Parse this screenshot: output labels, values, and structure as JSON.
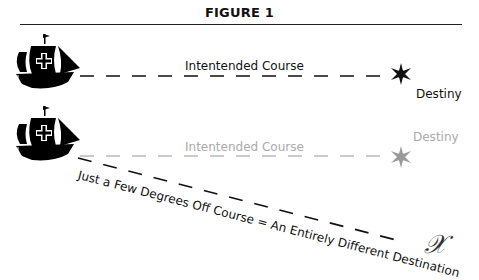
{
  "figure": {
    "title": "FIGURE 1",
    "top_course": {
      "label": "Intentended Course",
      "destination_label": "Destiny",
      "color": "#111111"
    },
    "bottom_course": {
      "label": "Intentended Course",
      "destination_label": "Destiny",
      "color": "#aaaaaa"
    },
    "off_course": {
      "label": "Just a Few Degrees Off Course = An Entirely Different Destination",
      "end_marker": "𝒳"
    },
    "icons": [
      "ship-icon",
      "star-icon",
      "x-marker-icon"
    ]
  }
}
